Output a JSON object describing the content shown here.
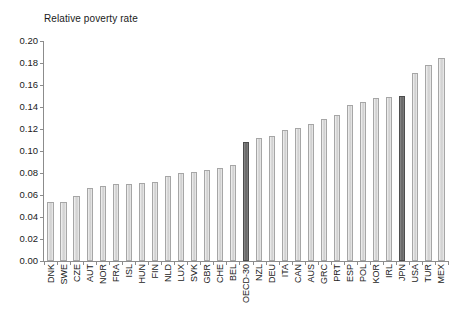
{
  "chart_data": {
    "type": "bar",
    "title": "Relative poverty rate",
    "xlabel": "",
    "ylabel": "Relative poverty rate",
    "ylim": [
      0.0,
      0.2
    ],
    "ytick_labels": [
      "0.20",
      "0.18",
      "0.16",
      "0.14",
      "0.12",
      "0.10",
      "0.08",
      "0.06",
      "0.04",
      "0.02",
      "0.00"
    ],
    "ytick_values": [
      0.2,
      0.18,
      0.16,
      0.14,
      0.12,
      0.1,
      0.08,
      0.06,
      0.04,
      0.02,
      0.0
    ],
    "grid": false,
    "legend": "none",
    "categories": [
      "DNK",
      "SWE",
      "CZE",
      "AUT",
      "NOR",
      "FRA",
      "ISL",
      "HUN",
      "FIN",
      "NLD",
      "LUX",
      "SVK",
      "GBR",
      "CHE",
      "BEL",
      "OECD-30",
      "NZL",
      "DEU",
      "ITA",
      "CAN",
      "AUS",
      "GRC",
      "PRT",
      "ESP",
      "POL",
      "KOR",
      "IRL",
      "JPN",
      "USA",
      "TUR",
      "MEX"
    ],
    "values": [
      0.054,
      0.054,
      0.059,
      0.066,
      0.068,
      0.07,
      0.07,
      0.071,
      0.072,
      0.077,
      0.08,
      0.081,
      0.083,
      0.085,
      0.087,
      0.108,
      0.112,
      0.114,
      0.119,
      0.121,
      0.125,
      0.129,
      0.133,
      0.142,
      0.145,
      0.148,
      0.149,
      0.15,
      0.171,
      0.178,
      0.185
    ],
    "highlighted": [
      "OECD-30",
      "JPN"
    ],
    "colors": {
      "bar_normal": "#d9d9d9",
      "bar_normal_border": "#a6a6a6",
      "bar_highlight": "#6e6e6e",
      "bar_highlight_border": "#4d4d4d",
      "axis": "#8c8c8c",
      "text": "#1a1a1a",
      "background": "#ffffff"
    }
  }
}
